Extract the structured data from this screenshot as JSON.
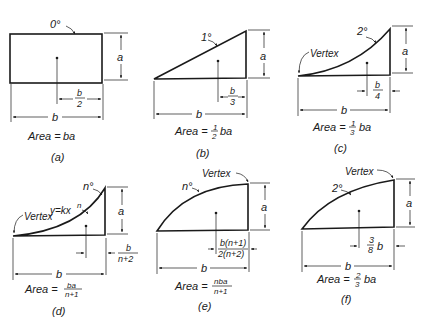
{
  "figures": [
    {
      "id": "a",
      "caption": "(a)",
      "degree_label": "0°",
      "height_label": "a",
      "width_label": "b",
      "centroid_label_num": "b",
      "centroid_label_den": "2",
      "area_prefix": "Area =",
      "area_formula": "ba"
    },
    {
      "id": "b",
      "caption": "(b)",
      "degree_label": "1°",
      "height_label": "a",
      "width_label": "b",
      "centroid_label_num": "b",
      "centroid_label_den": "3",
      "area_prefix": "Area =",
      "area_frac_num": "1",
      "area_frac_den": "2",
      "area_formula": "ba"
    },
    {
      "id": "c",
      "caption": "(c)",
      "degree_label": "2°",
      "vertex_label": "Vertex",
      "height_label": "a",
      "width_label": "b",
      "centroid_label_num": "b",
      "centroid_label_den": "4",
      "area_prefix": "Area =",
      "area_frac_num": "1",
      "area_frac_den": "3",
      "area_formula": "ba"
    },
    {
      "id": "d",
      "caption": "(d)",
      "degree_label": "n°",
      "equation_label": "y=kx",
      "equation_exp": "n",
      "vertex_label": "Vertex",
      "height_label": "a",
      "width_label": "b",
      "centroid_label_num": "b",
      "centroid_label_den": "n+2",
      "area_prefix": "Area =",
      "area_frac_num": "ba",
      "area_frac_den": "n+1"
    },
    {
      "id": "e",
      "caption": "(e)",
      "degree_label": "n°",
      "vertex_label": "Vertex",
      "height_label": "a",
      "width_label": "b",
      "centroid_label_num": "b(n+1)",
      "centroid_label_den": "2(n+2)",
      "area_prefix": "Area =",
      "area_frac_num": "nba",
      "area_frac_den": "n+1"
    },
    {
      "id": "f",
      "caption": "(f)",
      "degree_label": "2°",
      "vertex_label": "Vertex",
      "height_label": "a",
      "width_label": "b",
      "centroid_frac_num": "3",
      "centroid_frac_den": "8",
      "centroid_suffix": "b",
      "area_prefix": "Area =",
      "area_frac_num": "2",
      "area_frac_den": "3",
      "area_formula": "ba"
    }
  ]
}
